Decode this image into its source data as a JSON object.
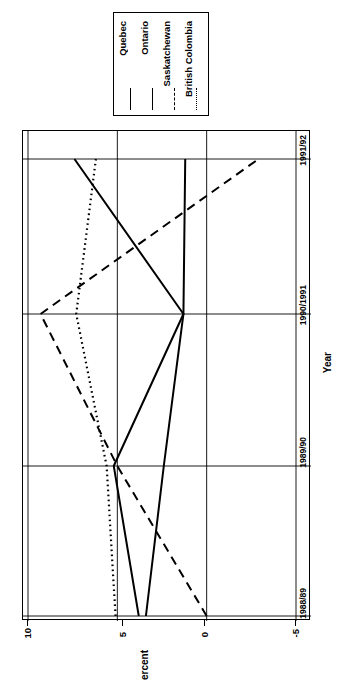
{
  "chart_data": {
    "type": "line",
    "title": "",
    "orientation": "rotated-90-counterclockwise",
    "xlabel": "Year",
    "ylabel": "Percent",
    "categories": [
      "1988/89",
      "1989/90",
      "1990/1991",
      "1991/92"
    ],
    "ylim": [
      -5,
      10
    ],
    "yticks": [
      10,
      5,
      0,
      -5
    ],
    "ytick_labels": [
      "10",
      "5",
      "0",
      "-5"
    ],
    "grid": true,
    "legend_position": "top",
    "series": [
      {
        "name": "Quebec",
        "style": "solid",
        "color": "#000000",
        "values": [
          3.8,
          5.2,
          1.3,
          7.4
        ]
      },
      {
        "name": "Ontario",
        "style": "solid",
        "color": "#000000",
        "values": [
          3.4,
          2.4,
          1.3,
          1.2
        ]
      },
      {
        "name": "Saskatchewan",
        "style": "dashed",
        "color": "#000000",
        "values": [
          0.0,
          5.0,
          9.3,
          -2.9
        ]
      },
      {
        "name": "British Colombia",
        "style": "dotted",
        "color": "#000000",
        "values": [
          5.1,
          5.6,
          7.3,
          6.2
        ]
      }
    ]
  },
  "legend": {
    "entries": [
      {
        "label": "Quebec",
        "style": "solid"
      },
      {
        "label": "Ontario",
        "style": "solid"
      },
      {
        "label": "Saskatchewan",
        "style": "dashed"
      },
      {
        "label": "British Colombia",
        "style": "dotted"
      }
    ]
  },
  "axes": {
    "y_title": "Percent",
    "x_title": "Year",
    "y_ticks": [
      "10",
      "5",
      "0",
      "-5"
    ],
    "x_ticks": [
      "1991/92",
      "1990/1991",
      "1989/90",
      "1988/89"
    ]
  }
}
